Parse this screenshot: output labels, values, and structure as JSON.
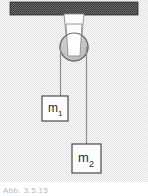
{
  "figure": {
    "background_color": "#ededed",
    "ceiling": {
      "name": "ceiling-bar",
      "color": "#4e4e4e",
      "x": 10,
      "y": 2,
      "width": 128,
      "height": 13
    },
    "bracket": {
      "name": "pulley-bracket",
      "color": "#fdfdfd",
      "edge_color": "#8a8a8a",
      "top_left_x": 64,
      "top_right_x": 84,
      "top_y": 15,
      "bottom_left_x": 68,
      "bottom_right_x": 80,
      "bottom_y": 55
    },
    "pulley": {
      "name": "pulley-wheel",
      "fill_color": "#c9c9c9",
      "stroke_color": "#6d6d6d",
      "cx": 74,
      "cy": 47,
      "r": 14
    },
    "strings": [
      {
        "name": "string-left",
        "x": 61,
        "y_top": 47,
        "y_bottom": 96,
        "color": "#8e8e8e"
      },
      {
        "name": "string-right",
        "x": 87,
        "y_top": 47,
        "y_bottom": 144,
        "color": "#8e8e8e"
      }
    ],
    "masses": [
      {
        "name": "mass-block-1",
        "symbol": "m",
        "subscript": "1",
        "label": "m1",
        "x": 42,
        "y": 96,
        "width": 26,
        "height": 25,
        "fill_color": "#fdfdfd",
        "stroke_color": "#4a4a4a",
        "text_color": "#2b2b2b"
      },
      {
        "name": "mass-block-2",
        "symbol": "m",
        "subscript": "2",
        "label": "m2",
        "x": 72,
        "y": 144,
        "width": 29,
        "height": 29,
        "fill_color": "#fdfdfd",
        "stroke_color": "#4a4a4a",
        "text_color": "#2b2b2b"
      }
    ]
  },
  "caption": {
    "text": "Abb. 3.5.15"
  }
}
